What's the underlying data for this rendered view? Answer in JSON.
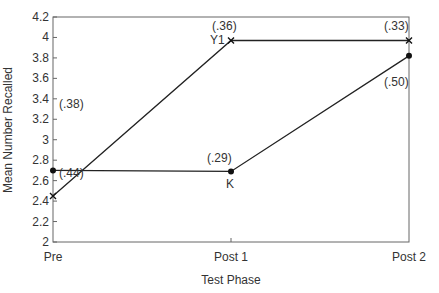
{
  "chart_data": {
    "type": "line",
    "title": "",
    "xlabel": "Test Phase",
    "ylabel": "Mean Number Recalled",
    "categories": [
      "Pre",
      "Post 1",
      "Post 2"
    ],
    "ylim": [
      2,
      4.2
    ],
    "yticks": [
      "2",
      "2.2",
      "2.4",
      "2.6",
      "2.8",
      "3",
      "3.2",
      "3.4",
      "3.6",
      "3.8",
      "4",
      "4.2"
    ],
    "grid": false,
    "series": [
      {
        "name": "Y1",
        "marker": "x",
        "values": [
          2.45,
          3.97,
          3.97
        ],
        "sd_labels": [
          "(.44)",
          "(.36)",
          "(.33)"
        ]
      },
      {
        "name": "K",
        "marker": "dot",
        "values": [
          2.7,
          2.69,
          3.82
        ],
        "sd_labels": [
          "(.38)",
          "(.29)",
          "(.50)"
        ]
      }
    ],
    "annotations": [
      "Y1",
      "K"
    ]
  }
}
